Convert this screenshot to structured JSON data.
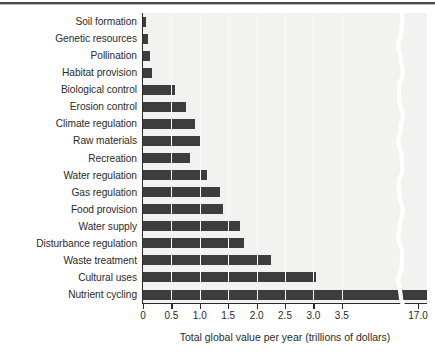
{
  "figure": {
    "background_color": "#ffffff",
    "plot_background_color": "#f2f2f0",
    "bar_color": "#3d3d3f",
    "axis_color": "#2d2a28",
    "top_rule_color": "#4b4b4d"
  },
  "axes": {
    "ylabel": "Type of ecosystem service",
    "xlabel": "Total global value per year (trillions of dollars)",
    "xticks": [
      "0",
      "0.5",
      "1.0",
      "1.5",
      "2.0",
      "2.5",
      "3.0",
      "3.5",
      "17.0"
    ],
    "axis_break": true,
    "axis_break_after": "3.5"
  },
  "chart_data": {
    "type": "bar",
    "orientation": "horizontal",
    "title": "",
    "xlabel": "Total global value per year (trillions of dollars)",
    "ylabel": "Type of ecosystem service",
    "xlim": [
      0,
      3.75
    ],
    "xticks": [
      0,
      0.5,
      1.0,
      1.5,
      2.0,
      2.5,
      3.0,
      3.5,
      17.0
    ],
    "xtick_labels": [
      "0",
      "0.5",
      "1.0",
      "1.5",
      "2.0",
      "2.5",
      "3.0",
      "3.5",
      "17.0"
    ],
    "axis_break": {
      "present": true,
      "before": 3.6,
      "after": 17.0
    },
    "grid": true,
    "legend": null,
    "categories": [
      "Soil formation",
      "Genetic resources",
      "Pollination",
      "Habitat provision",
      "Biological control",
      "Erosion control",
      "Climate regulation",
      "Raw materials",
      "Recreation",
      "Water regulation",
      "Gas regulation",
      "Food provision",
      "Water supply",
      "Disturbance regulation",
      "Waste treatment",
      "Cultural uses",
      "Nutrient cycling"
    ],
    "values": [
      0.05,
      0.09,
      0.12,
      0.15,
      0.55,
      0.75,
      0.92,
      1.0,
      0.82,
      1.13,
      1.35,
      1.4,
      1.7,
      1.78,
      2.25,
      3.05,
      17.0
    ],
    "bars": [
      {
        "label": "Soil formation",
        "value": 0.05,
        "px": 3
      },
      {
        "label": "Genetic resources",
        "value": 0.09,
        "px": 5
      },
      {
        "label": "Pollination",
        "value": 0.12,
        "px": 7
      },
      {
        "label": "Habitat provision",
        "value": 0.15,
        "px": 9
      },
      {
        "label": "Biological control",
        "value": 0.55,
        "px": 32
      },
      {
        "label": "Erosion control",
        "value": 0.75,
        "px": 43
      },
      {
        "label": "Climate regulation",
        "value": 0.92,
        "px": 52
      },
      {
        "label": "Raw materials",
        "value": 1.0,
        "px": 57
      },
      {
        "label": "Recreation",
        "value": 0.82,
        "px": 47
      },
      {
        "label": "Water regulation",
        "value": 1.13,
        "px": 64
      },
      {
        "label": "Gas regulation",
        "value": 1.35,
        "px": 77
      },
      {
        "label": "Food provision",
        "value": 1.4,
        "px": 80
      },
      {
        "label": "Water supply",
        "value": 1.7,
        "px": 97
      },
      {
        "label": "Disturbance regulation",
        "value": 1.78,
        "px": 101
      },
      {
        "label": "Waste treatment",
        "value": 2.25,
        "px": 128
      },
      {
        "label": "Cultural uses",
        "value": 3.05,
        "px": 173
      },
      {
        "label": "Nutrient cycling",
        "value": 17.0,
        "px": 284
      }
    ]
  }
}
